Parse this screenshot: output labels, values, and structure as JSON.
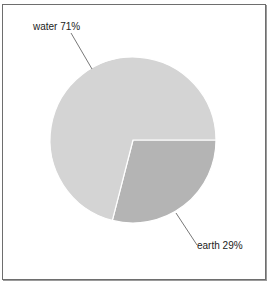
{
  "chart_data": {
    "type": "pie",
    "title": "",
    "categories": [
      "water",
      "earth"
    ],
    "values": [
      71,
      29
    ],
    "unit": "%",
    "labels": [
      "water 71%",
      "earth 29%"
    ],
    "colors": [
      "#d4d4d4",
      "#b4b4b4"
    ],
    "start_angle_deg": 0,
    "direction": "clockwise",
    "legend": "none",
    "label_style": "outside with leader lines"
  },
  "slices": [
    {
      "name": "water",
      "value": 71,
      "label": "water 71%",
      "color": "#d4d4d4"
    },
    {
      "name": "earth",
      "value": 29,
      "label": "earth 29%",
      "color": "#b4b4b4"
    }
  ]
}
